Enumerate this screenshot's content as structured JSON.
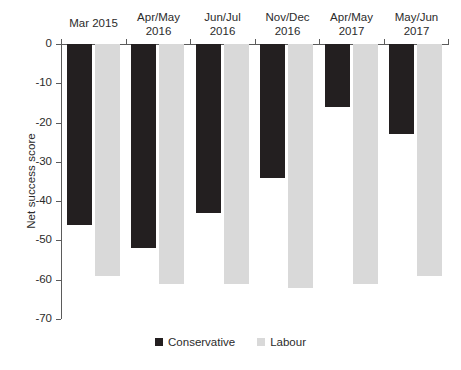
{
  "chart_data": {
    "type": "bar",
    "title": "",
    "subtitle": "",
    "xlabel": "",
    "ylabel": "Net success score",
    "categories": [
      "Mar 2015",
      "Apr/May\n2016",
      "Jun/Jul\n2016",
      "Nov/Dec\n2016",
      "Apr/May\n2017",
      "May/Jun\n2017"
    ],
    "series": [
      {
        "name": "Conservative",
        "color": "#231f20",
        "values": [
          -46,
          -52,
          -43,
          -34,
          -16,
          -23
        ]
      },
      {
        "name": "Labour",
        "color": "#d9d9d9",
        "values": [
          -59,
          -61,
          -61,
          -62,
          -61,
          -59
        ]
      }
    ],
    "ylim": [
      -70,
      0
    ],
    "ytick_labels": [
      "0",
      "-10",
      "-20",
      "-30",
      "-40",
      "-50",
      "-60",
      "-70"
    ],
    "ytick_values": [
      0,
      -10,
      -20,
      -30,
      -40,
      -50,
      -60,
      -70
    ],
    "grid": false,
    "legend_position": "bottom",
    "legend_entries": [
      "Conservative",
      "Labour"
    ],
    "axis_color": "#5b5b5b",
    "text_color": "#2b2b2b",
    "background": "#ffffff"
  }
}
